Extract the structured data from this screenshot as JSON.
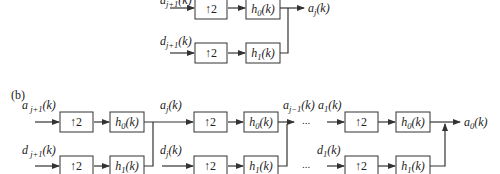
{
  "figure": {
    "panel_a": {
      "inputs": {
        "approx": "a_{j+1}(k)",
        "detail": "d_{j+1}(k)"
      },
      "blocks": {
        "up_top": "↑2",
        "up_bottom": "↑2",
        "filter_top": "h0(k)",
        "filter_bottom": "h1(k)"
      },
      "output": "a_j(k)"
    },
    "panel_b": {
      "label": "(b)",
      "stages": [
        {
          "inputs": {
            "approx": "a_{j+1}(k)",
            "detail": "d_{j+1}(k)"
          },
          "blocks": {
            "up_top": "↑2",
            "up_bottom": "↑2",
            "filter_top": "h0(k)",
            "filter_bottom": "h1(k)"
          },
          "output": "a_j(k)"
        },
        {
          "inputs": {
            "approx": "a_j(k)",
            "detail": "d_j(k)"
          },
          "blocks": {
            "up_top": "↑2",
            "up_bottom": "↑2",
            "filter_top": "h0(k)",
            "filter_bottom": "h1(k)"
          },
          "output": "a_{j-1}(k)"
        },
        {
          "inputs": {
            "approx": "a_1(k)",
            "detail": "d_1(k)"
          },
          "blocks": {
            "up_top": "↑2",
            "up_bottom": "↑2",
            "filter_top": "h0(k)",
            "filter_bottom": "h1(k)"
          },
          "output": "a_0(k)"
        }
      ],
      "ellipsis": "..."
    }
  }
}
